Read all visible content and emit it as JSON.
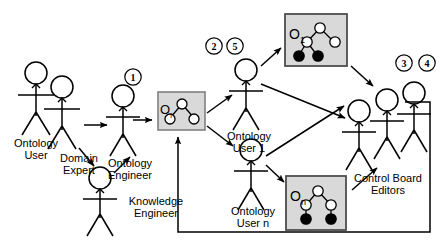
{
  "diagram": {
    "background": "#ffffff",
    "stroke_color": "#000000",
    "box_fill": "#d9d9d9",
    "box_stroke": "#808080",
    "node_fill_empty": "#ffffff",
    "node_fill_solid": "#000000",
    "actors": [
      {
        "id": "ontology-user",
        "label": "Ontology\nUser"
      },
      {
        "id": "domain-expert",
        "label": "Domain\nExpert"
      },
      {
        "id": "knowledge-engineer",
        "label": "Knowledge\nEngineer"
      },
      {
        "id": "ontology-engineer",
        "label": "Ontology\nEngineer"
      },
      {
        "id": "ontology-user-1",
        "label": "Ontology\nUser 1"
      },
      {
        "id": "ontology-user-n",
        "label": "Ontology\nUser n"
      },
      {
        "id": "control-board-editors",
        "label": "Control Board\nEditors"
      }
    ],
    "ontology_boxes": [
      {
        "id": "ontology-o-i",
        "base": "O",
        "subscript": "i",
        "nodes_empty": 3,
        "nodes_solid": 0
      },
      {
        "id": "ontology-o-1",
        "base": "O",
        "subscript": "1",
        "nodes_empty": 3,
        "nodes_solid": 2
      },
      {
        "id": "ontology-o-n",
        "base": "O",
        "subscript": "n",
        "nodes_empty": 3,
        "nodes_solid": 2
      }
    ],
    "step_markers": [
      {
        "id": "step-1",
        "label": "1"
      },
      {
        "id": "step-2",
        "label": "2"
      },
      {
        "id": "step-5",
        "label": "5"
      },
      {
        "id": "step-3",
        "label": "3"
      },
      {
        "id": "step-4",
        "label": "4"
      }
    ]
  }
}
